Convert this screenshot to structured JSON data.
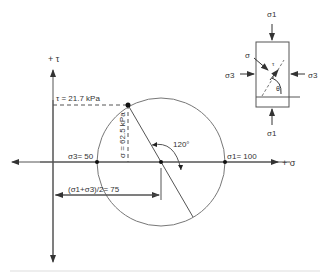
{
  "diagram": {
    "axes": {
      "tau_axis_label": "+ τ",
      "sigma_axis_label": "+ σ"
    },
    "labels": {
      "tau_value": "τ = 21.7 kPa",
      "sigma_value": "σ = 62.5 kPa",
      "sigma3": "σ3= 50",
      "sigma1": "σ1= 100",
      "center": "(σ1+σ3)/2= 75",
      "angle": "120°"
    },
    "element": {
      "sigma1_top": "σ1",
      "sigma1_bottom": "σ1",
      "sigma3_left": "σ3",
      "sigma3_right": "σ3",
      "sigma_plane": "σ",
      "tau_plane": "τ",
      "theta": "θ"
    },
    "values": {
      "sigma1": 100,
      "sigma3": 50,
      "center": 75,
      "tau": 21.7,
      "sigma": 62.5,
      "angle_deg": 120
    },
    "colors": {
      "line": "#555555",
      "text": "#333333"
    }
  }
}
